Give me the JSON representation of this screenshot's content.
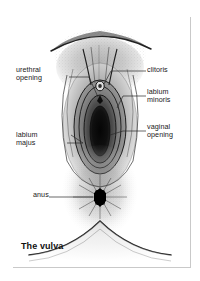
{
  "figure": {
    "title": "The vulva",
    "subject": "vulva",
    "frame_color": "#8a8a8a",
    "background_color": "#ffffff",
    "ink_color": "#1a1a1a"
  },
  "labels": [
    {
      "id": "urethral-opening",
      "text_line1": "urethral",
      "text_line2": "opening",
      "side": "left"
    },
    {
      "id": "clitoris",
      "text_line1": "clitoris",
      "text_line2": "",
      "side": "right"
    },
    {
      "id": "labium-minoris",
      "text_line1": "labium",
      "text_line2": "minoris",
      "side": "right"
    },
    {
      "id": "vaginal-opening",
      "text_line1": "vaginal",
      "text_line2": "opening",
      "side": "right"
    },
    {
      "id": "labium-majus",
      "text_line1": "labium",
      "text_line2": "majus",
      "side": "left"
    },
    {
      "id": "anus",
      "text_line1": "anus",
      "text_line2": "",
      "side": "left"
    }
  ]
}
